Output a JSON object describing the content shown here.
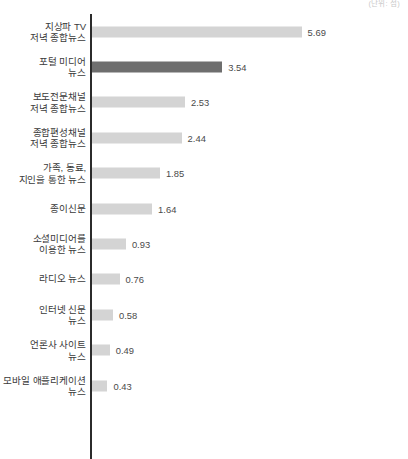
{
  "chart_data": {
    "type": "bar",
    "orientation": "horizontal",
    "title": "",
    "subtitle": "",
    "unit_note": "(단위: 점)",
    "xlabel": "",
    "ylabel": "",
    "grid": false,
    "legend": false,
    "axis_line": true,
    "xlim": [
      0,
      5.69
    ],
    "px_per_unit": 36.9,
    "colors": {
      "bar": "#d4d4d4",
      "bar_highlight": "#6e6e6e",
      "axis": "#2b2b2b",
      "label_text": "#3a3a3a",
      "value_text": "#4a4a4a",
      "unit_text": "#c9c9c9",
      "background": "#ffffff"
    },
    "categories": [
      "지상파 TV\n저녁 종합뉴스",
      "포털 미디어\n뉴스",
      "보도전문채널\n저녁 종합뉴스",
      "종합편성채널\n저녁 종합뉴스",
      "가족, 동료,\n지인을 통한 뉴스",
      "종이신문",
      "소셜미디어를\n이용한 뉴스",
      "라디오 뉴스",
      "인터넷 신문\n뉴스",
      "언론사 사이트\n뉴스",
      "모바일 애플리케이션\n뉴스"
    ],
    "values": [
      5.69,
      3.54,
      2.53,
      2.44,
      1.85,
      1.64,
      0.93,
      0.76,
      0.58,
      0.49,
      0.43
    ],
    "value_labels": [
      "5.69",
      "3.54",
      "2.53",
      "2.44",
      "1.85",
      "1.64",
      "0.93",
      "0.76",
      "0.58",
      "0.49",
      "0.43"
    ],
    "highlighted_index": 1,
    "bars": [
      {
        "label": "지상파 TV\n저녁 종합뉴스",
        "value": 5.69,
        "value_label": "5.69",
        "highlight": false
      },
      {
        "label": "포털 미디어\n뉴스",
        "value": 3.54,
        "value_label": "3.54",
        "highlight": true
      },
      {
        "label": "보도전문채널\n저녁 종합뉴스",
        "value": 2.53,
        "value_label": "2.53",
        "highlight": false
      },
      {
        "label": "종합편성채널\n저녁 종합뉴스",
        "value": 2.44,
        "value_label": "2.44",
        "highlight": false
      },
      {
        "label": "가족, 동료,\n지인을 통한 뉴스",
        "value": 1.85,
        "value_label": "1.85",
        "highlight": false
      },
      {
        "label": "종이신문",
        "value": 1.64,
        "value_label": "1.64",
        "highlight": false
      },
      {
        "label": "소셜미디어를\n이용한 뉴스",
        "value": 0.93,
        "value_label": "0.93",
        "highlight": false
      },
      {
        "label": "라디오 뉴스",
        "value": 0.76,
        "value_label": "0.76",
        "highlight": false
      },
      {
        "label": "인터넷 신문\n뉴스",
        "value": 0.58,
        "value_label": "0.58",
        "highlight": false
      },
      {
        "label": "언론사 사이트\n뉴스",
        "value": 0.49,
        "value_label": "0.49",
        "highlight": false
      },
      {
        "label": "모바일 애플리케이션\n뉴스",
        "value": 0.43,
        "value_label": "0.43",
        "highlight": false
      }
    ]
  }
}
